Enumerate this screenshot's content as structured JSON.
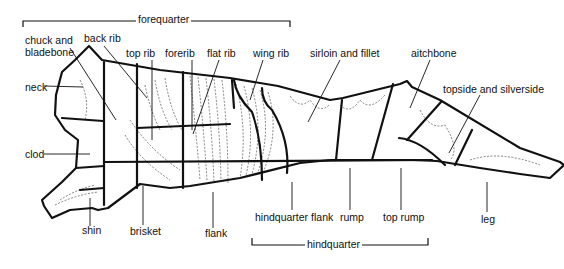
{
  "diagram": {
    "type": "beef-carcass-cuts",
    "colors": {
      "outline": "#111111",
      "background": "#ffffff"
    }
  },
  "sections": {
    "forequarter": "forequarter",
    "hindquarter": "hindquarter"
  },
  "labels": {
    "chuck_line1": "chuck and",
    "chuck_line2": "bladebone",
    "back_rib": "back rib",
    "top_rib": "top rib",
    "forerib": "forerib",
    "flat_rib": "flat rib",
    "wing_rib": "wing rib",
    "sirloin": "sirloin and fillet",
    "aitchbone": "aitchbone",
    "topside": "topside and silverside",
    "neck": "neck",
    "clod": "clod",
    "shin": "shin",
    "brisket": "brisket",
    "flank": "flank",
    "hindquarter_flank": "hindquarter flank",
    "rump": "rump",
    "top_rump": "top rump",
    "leg": "leg"
  }
}
